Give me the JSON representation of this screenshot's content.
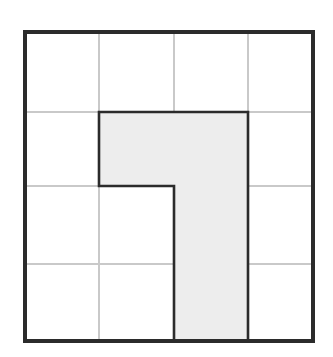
{
  "figure": {
    "type": "geometry-grid-diagram",
    "background_color": "#ffffff",
    "canvas": {
      "width": 333,
      "height": 357
    },
    "frame": {
      "label": "outer square border",
      "x": 25,
      "y": 32,
      "width": 288,
      "height": 309,
      "stroke_color": "#2b2b2b",
      "stroke_width": 3.6
    },
    "grid": {
      "label": "4 by 4 unit grid",
      "columns": 4,
      "rows": 4,
      "line_color": "#c9c9c9",
      "line_width": 1.1,
      "vertical_line_x": [
        99,
        174,
        248
      ],
      "horizontal_line_y": [
        112,
        186,
        264
      ],
      "cell_width": 72,
      "cell_height": 77.25
    },
    "shape": {
      "label": "shaded flag polygon",
      "fill_color": "#ededed",
      "stroke_color": "#2b2b2b",
      "stroke_width": 2.6,
      "area_cells": 5,
      "points": "99,112 248,112 248,341 174,341 174,186 99,186",
      "vertices": [
        {
          "x": 99,
          "y": 112
        },
        {
          "x": 248,
          "y": 112
        },
        {
          "x": 248,
          "y": 341
        },
        {
          "x": 174,
          "y": 341
        },
        {
          "x": 174,
          "y": 186
        },
        {
          "x": 99,
          "y": 186
        }
      ]
    }
  }
}
